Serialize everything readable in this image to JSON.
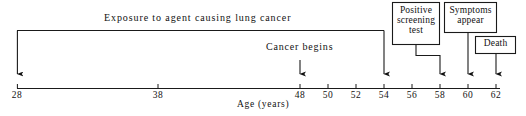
{
  "figure": {
    "type": "timeline-diagram",
    "title_text": "Exposure to agent causing lung cancer",
    "axis": {
      "label": "Age (years)",
      "unit": "years",
      "start_age": 28,
      "end_age": 62,
      "ticks": [
        {
          "age": 28,
          "label": "28",
          "x": 17
        },
        {
          "age": 38,
          "label": "38",
          "x": 158
        },
        {
          "age": 48,
          "label": "48",
          "x": 300
        },
        {
          "age": 50,
          "label": "50",
          "x": 328
        },
        {
          "age": 52,
          "label": "52",
          "x": 356
        },
        {
          "age": 54,
          "label": "54",
          "x": 384
        },
        {
          "age": 56,
          "label": "56",
          "x": 412
        },
        {
          "age": 58,
          "label": "58",
          "x": 440
        },
        {
          "age": 60,
          "label": "60",
          "x": 468
        },
        {
          "age": 62,
          "label": "62",
          "x": 496
        }
      ]
    },
    "exposure_band": {
      "label": "Exposure to agent causing lung cancer",
      "start_age": 28,
      "end_age": 54
    },
    "events": [
      {
        "name": "cancer-begins",
        "label": "Cancer begins",
        "age": 48,
        "style": "plain-text"
      },
      {
        "name": "positive-screening-test",
        "label": "Positive screening test",
        "lines": [
          "Positive",
          "screening",
          "test"
        ],
        "age": 58,
        "style": "boxed"
      },
      {
        "name": "symptoms-appear",
        "label": "Symptoms appear",
        "lines": [
          "Symptoms",
          "appear"
        ],
        "age": 60,
        "style": "boxed"
      },
      {
        "name": "death",
        "label": "Death",
        "lines": [
          "Death"
        ],
        "age": 62,
        "style": "boxed"
      }
    ],
    "colors": {
      "background": "#ffffff",
      "ink": "#111111",
      "line": "#1a1a1a"
    }
  }
}
